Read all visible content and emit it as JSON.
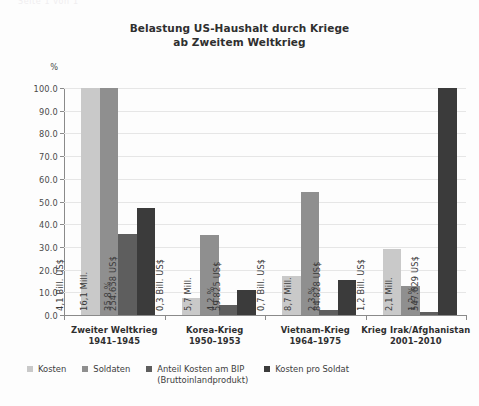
{
  "top_fragment": "Seite 1 von 1",
  "chart_data": {
    "type": "bar",
    "title": "Belastung US-Haushalt durch Kriege ab Zweitem Weltkrieg",
    "title_lines": [
      "Belastung US-Haushalt durch Kriege",
      "ab Zweitem Weltkrieg"
    ],
    "xlabel": "",
    "ylabel": "%",
    "ylim": [
      0.0,
      100.0
    ],
    "ytick_labels": [
      "100.0",
      "90.0",
      "80.0",
      "70.0",
      "60.0",
      "50.0",
      "40.0",
      "30.0",
      "20.0",
      "10.0",
      "0.0"
    ],
    "ytick_values": [
      100.0,
      90.0,
      80.0,
      70.0,
      60.0,
      50.0,
      40.0,
      30.0,
      20.0,
      10.0,
      0.0
    ],
    "grid": true,
    "legend_position": "bottom-left",
    "categories": [
      "Zweiter Weltkrieg",
      "Korea-Krieg",
      "Vietnam-Krieg",
      "Krieg Irak/Afghanistan"
    ],
    "category_years": [
      "1941–1945",
      "1950–1953",
      "1964–1975",
      "2001–2010"
    ],
    "series": [
      {
        "name": "Kosten",
        "color": "#c9c9c9",
        "values": [
          100.0,
          7.3,
          17.0,
          29.3
        ],
        "labels": [
          "4,1 Bill. US$",
          "0,3 Bill. US$",
          "0,7 Bill. US$",
          "1,2 Bill. US$"
        ]
      },
      {
        "name": "Soldaten",
        "color": "#8f8f8f",
        "values": [
          100.0,
          35.4,
          54.0,
          13.0
        ],
        "labels": [
          "16,1 Mill.",
          "5,7 Mill.",
          "8,7 Mill.",
          "2,1 Mill."
        ]
      },
      {
        "name": "Anteil Kosten am BIP (Bruttoinlandprodukt)",
        "name_line1": "Anteil Kosten am BIP",
        "name_line2": "(Bruttoinlandprodukt)",
        "color": "#5e5e5e",
        "values": [
          35.8,
          4.2,
          2.3,
          1.2
        ],
        "labels": [
          "35,8 %",
          "4,2 %",
          "2,3 %",
          "1,2 %"
        ]
      },
      {
        "name": "Kosten pro Soldat",
        "color": "#3b3b3b",
        "values": [
          47.0,
          11.0,
          15.5,
          100.0
        ],
        "labels": [
          "254.658 US$",
          "59.825 US$",
          "84.828 US$",
          "547.629 US$"
        ]
      }
    ]
  }
}
